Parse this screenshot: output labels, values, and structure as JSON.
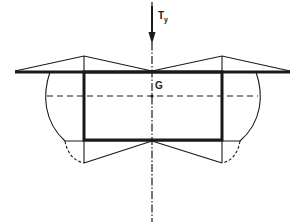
{
  "diagram": {
    "type": "structural-stress-distribution",
    "labels": {
      "load": "T",
      "load_subscript": "y",
      "centroid": "G"
    },
    "colors": {
      "line": "#1a1a1a",
      "background": "#ffffff"
    },
    "elements": [
      "flange-line",
      "web-rectangle",
      "neutral-axis-dashed",
      "symmetry-axis-dash-dot",
      "load-arrow-Ty",
      "top-stress-triangles",
      "bottom-stress-triangles",
      "side-shear-curves"
    ]
  }
}
